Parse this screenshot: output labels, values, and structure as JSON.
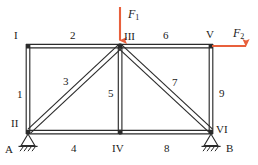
{
  "figure": {
    "type": "planar-truss-free-body-diagram",
    "background_color": "#ffffff",
    "member_color": "#2b2b2b",
    "force_color": "#e8603c",
    "text_color": "#1a1a1a"
  },
  "nodes": [
    {
      "id": "n1",
      "label": "I",
      "x": 28,
      "y": 46,
      "label_x": 14,
      "label_y": 30
    },
    {
      "id": "n2",
      "label": "II",
      "x": 28,
      "y": 132,
      "label_x": 11,
      "label_y": 118
    },
    {
      "id": "n3",
      "label": "III",
      "x": 120,
      "y": 46,
      "label_x": 124,
      "label_y": 31
    },
    {
      "id": "n4",
      "label": "IV",
      "x": 120,
      "y": 132,
      "label_x": 112,
      "label_y": 143
    },
    {
      "id": "n5",
      "label": "V",
      "x": 211,
      "y": 46,
      "label_x": 206,
      "label_y": 29
    },
    {
      "id": "n6",
      "label": "VI",
      "x": 211,
      "y": 132,
      "label_x": 216,
      "label_y": 124
    }
  ],
  "members": [
    {
      "id": "m1",
      "label": "1",
      "from": "n1",
      "to": "n2",
      "kind": "vertical",
      "label_x": 17,
      "label_y": 89
    },
    {
      "id": "m2",
      "label": "2",
      "from": "n1",
      "to": "n3",
      "kind": "horizontal",
      "label_x": 70,
      "label_y": 30
    },
    {
      "id": "m3",
      "label": "3",
      "from": "n2",
      "to": "n3",
      "kind": "diagonal",
      "label_x": 63,
      "label_y": 76
    },
    {
      "id": "m4",
      "label": "4",
      "from": "n2",
      "to": "n4",
      "kind": "horizontal",
      "label_x": 71,
      "label_y": 143
    },
    {
      "id": "m5",
      "label": "5",
      "from": "n3",
      "to": "n4",
      "kind": "vertical",
      "label_x": 108,
      "label_y": 88
    },
    {
      "id": "m6",
      "label": "6",
      "from": "n3",
      "to": "n5",
      "kind": "horizontal",
      "label_x": 163,
      "label_y": 30
    },
    {
      "id": "m7",
      "label": "7",
      "from": "n3",
      "to": "n6",
      "kind": "diagonal",
      "label_x": 172,
      "label_y": 77
    },
    {
      "id": "m8",
      "label": "8",
      "from": "n4",
      "to": "n6",
      "kind": "horizontal",
      "label_x": 164,
      "label_y": 143
    },
    {
      "id": "m9",
      "label": "9",
      "from": "n5",
      "to": "n6",
      "kind": "vertical",
      "label_x": 219,
      "label_y": 88
    }
  ],
  "supports": [
    {
      "id": "sA",
      "label": "A",
      "at_node": "n2",
      "type": "pin-hatched",
      "x": 28,
      "y": 132,
      "label_x": 5,
      "label_y": 144
    },
    {
      "id": "sB",
      "label": "B",
      "at_node": "n6",
      "type": "pin-hatched",
      "x": 211,
      "y": 132,
      "label_x": 226,
      "label_y": 143
    }
  ],
  "forces": [
    {
      "id": "F1",
      "name": "F",
      "subscript": "1",
      "at_node": "n3",
      "direction": "down",
      "color": "#e8603c",
      "label_x": 128,
      "label_y": 8,
      "tail_x": 120,
      "tail_y": 7,
      "head_x": 120,
      "head_y": 44
    },
    {
      "id": "F2",
      "name": "F",
      "subscript": "2",
      "at_node": "n5",
      "direction": "right",
      "color": "#e8603c",
      "label_x": 233,
      "label_y": 27,
      "tail_x": 212,
      "tail_y": 46,
      "head_x": 250,
      "head_y": 46
    }
  ]
}
